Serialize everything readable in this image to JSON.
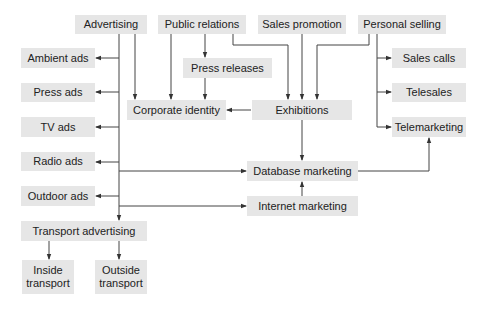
{
  "diagram": {
    "type": "flowchart",
    "colors": {
      "box_fill": "#e6e6e6",
      "line": "#444444",
      "text": "#222222"
    },
    "nodes": {
      "advertising": {
        "label": "Advertising"
      },
      "public_relations": {
        "label": "Public relations"
      },
      "sales_promotion": {
        "label": "Sales promotion"
      },
      "personal_selling": {
        "label": "Personal selling"
      },
      "ambient_ads": {
        "label": "Ambient ads"
      },
      "press_ads": {
        "label": "Press ads"
      },
      "tv_ads": {
        "label": "TV ads"
      },
      "radio_ads": {
        "label": "Radio ads"
      },
      "outdoor_ads": {
        "label": "Outdoor ads"
      },
      "transport_advertising": {
        "label": "Transport advertising"
      },
      "inside_transport": {
        "label": "Inside transport"
      },
      "outside_transport": {
        "label": "Outside transport"
      },
      "press_releases": {
        "label": "Press releases"
      },
      "corporate_identity": {
        "label": "Corporate identity"
      },
      "exhibitions": {
        "label": "Exhibitions"
      },
      "database_marketing": {
        "label": "Database marketing"
      },
      "internet_marketing": {
        "label": "Internet marketing"
      },
      "sales_calls": {
        "label": "Sales calls"
      },
      "telesales": {
        "label": "Telesales"
      },
      "telemarketing": {
        "label": "Telemarketing"
      }
    },
    "edges": [
      [
        "Advertising",
        "Ambient ads"
      ],
      [
        "Advertising",
        "Press ads"
      ],
      [
        "Advertising",
        "TV ads"
      ],
      [
        "Advertising",
        "Radio ads"
      ],
      [
        "Advertising",
        "Outdoor ads"
      ],
      [
        "Advertising",
        "Transport advertising"
      ],
      [
        "Advertising",
        "Corporate identity"
      ],
      [
        "Advertising",
        "Database marketing"
      ],
      [
        "Advertising",
        "Internet marketing"
      ],
      [
        "Transport advertising",
        "Inside transport"
      ],
      [
        "Transport advertising",
        "Outside transport"
      ],
      [
        "Public relations",
        "Corporate identity"
      ],
      [
        "Public relations",
        "Press releases"
      ],
      [
        "Public relations",
        "Exhibitions"
      ],
      [
        "Press releases",
        "Corporate identity"
      ],
      [
        "Sales promotion",
        "Exhibitions"
      ],
      [
        "Personal selling",
        "Exhibitions"
      ],
      [
        "Personal selling",
        "Sales calls"
      ],
      [
        "Personal selling",
        "Telesales"
      ],
      [
        "Personal selling",
        "Telemarketing"
      ],
      [
        "Exhibitions",
        "Corporate identity"
      ],
      [
        "Exhibitions",
        "Database marketing"
      ],
      [
        "Internet marketing",
        "Database marketing"
      ],
      [
        "Database marketing",
        "Telemarketing"
      ]
    ]
  }
}
